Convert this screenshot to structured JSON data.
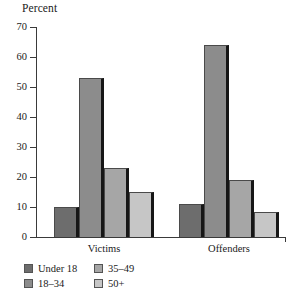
{
  "chart_data": {
    "type": "bar",
    "title": "",
    "subtitle": "",
    "xlabel": "",
    "ylabel": "Percent",
    "ylim": [
      0,
      70
    ],
    "yticks": [
      0,
      10,
      20,
      30,
      40,
      50,
      60,
      70
    ],
    "ytick_labels": [
      "0",
      "10",
      "20",
      "30",
      "40",
      "50",
      "60",
      "70"
    ],
    "grid": false,
    "legend_position": "bottom-left",
    "categories": [
      "Victims",
      "Offenders"
    ],
    "series": [
      {
        "name": "Under 18",
        "color": "#6d6d6d",
        "values": [
          10,
          11
        ]
      },
      {
        "name": "18–34",
        "color": "#8c8c8c",
        "values": [
          53,
          64
        ]
      },
      {
        "name": "35–49",
        "color": "#a6a6a6",
        "values": [
          23,
          19
        ]
      },
      {
        "name": "50+",
        "color": "#c6c6c6",
        "values": [
          15,
          8.5
        ]
      }
    ],
    "legend_order": [
      "Under 18",
      "35–49",
      "18–34",
      "50+"
    ]
  },
  "axis": {
    "y_title": "Percent"
  }
}
